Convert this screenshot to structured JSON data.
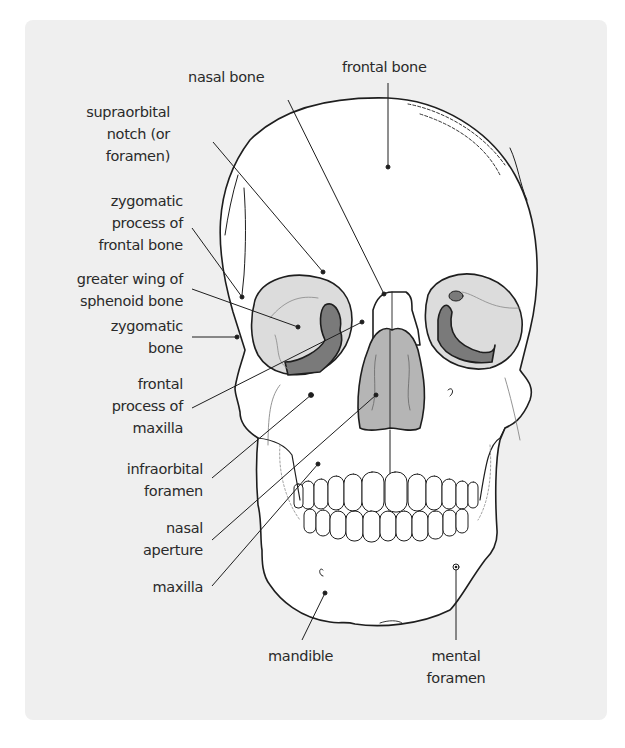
{
  "figure": {
    "colors": {
      "panel_bg": "#efefef",
      "bone_fill": "#ffffff",
      "orbit_fill": "#dcdcdc",
      "dark_shade": "#7a7a7a",
      "nasal_fill": "#b5b5b5",
      "outline": "#1e1e1e",
      "text": "#2a2a2a"
    },
    "labels": {
      "nasal_bone": [
        "nasal bone"
      ],
      "frontal_bone": [
        "frontal bone"
      ],
      "supraorbital_notch": [
        "supraorbital",
        "notch (or",
        "foramen)"
      ],
      "zygomatic_process": [
        "zygomatic",
        "process of",
        "frontal bone"
      ],
      "greater_wing": [
        "greater wing of",
        "sphenoid bone"
      ],
      "zygomatic_bone": [
        "zygomatic",
        "bone"
      ],
      "frontal_process": [
        "frontal",
        "process of",
        "maxilla"
      ],
      "infraorbital_foramen": [
        "infraorbital",
        "foramen"
      ],
      "nasal_aperture": [
        "nasal",
        "aperture"
      ],
      "maxilla": [
        "maxilla"
      ],
      "mandible": [
        "mandible"
      ],
      "mental_foramen": [
        "mental",
        "foramen"
      ]
    }
  }
}
